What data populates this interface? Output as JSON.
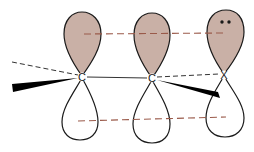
{
  "diagram": {
    "type": "p-orbital overlap (allyl-type system)",
    "colors": {
      "upper_lobe_fill": "#c9b0a6",
      "lobe_outline": "#1a1a1a",
      "overlap_dash": "#9a5a4a",
      "bond_dash": "#333333",
      "wedge": "#000000",
      "background": "#ffffff"
    },
    "atoms": [
      {
        "label": "C"
      },
      {
        "label": "C"
      },
      {
        "label": "X"
      }
    ],
    "lone_pair": "••"
  }
}
